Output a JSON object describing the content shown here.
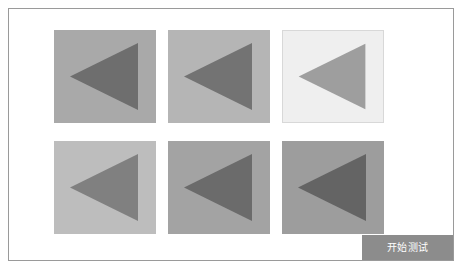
{
  "window": {
    "background": "#ffffff",
    "frame_border_color": "#9a9a9a"
  },
  "grid": {
    "rows": 2,
    "columns": 3,
    "tiles": [
      {
        "index": 0,
        "row": 0,
        "column": 0,
        "name": "tile-0-0",
        "background": "#a9a9a9",
        "shape": "left-pointing-triangle",
        "shape_color": "#6e6e6e",
        "outlined": false
      },
      {
        "index": 1,
        "row": 0,
        "column": 1,
        "name": "tile-0-1",
        "background": "#b5b5b5",
        "shape": "left-pointing-triangle",
        "shape_color": "#737373",
        "outlined": false
      },
      {
        "index": 2,
        "row": 0,
        "column": 2,
        "name": "tile-0-2",
        "background": "#efefef",
        "shape": "left-pointing-triangle",
        "shape_color": "#9e9e9e",
        "outlined": true
      },
      {
        "index": 3,
        "row": 1,
        "column": 0,
        "name": "tile-1-0",
        "background": "#bdbdbd",
        "shape": "left-pointing-triangle",
        "shape_color": "#808080",
        "outlined": false
      },
      {
        "index": 4,
        "row": 1,
        "column": 1,
        "name": "tile-1-1",
        "background": "#a3a3a3",
        "shape": "left-pointing-triangle",
        "shape_color": "#6b6b6b",
        "outlined": false
      },
      {
        "index": 5,
        "row": 1,
        "column": 2,
        "name": "tile-1-2",
        "background": "#9d9d9d",
        "shape": "left-pointing-triangle",
        "shape_color": "#646464",
        "outlined": false
      }
    ]
  },
  "actions": {
    "start_test_label": "开始测试",
    "start_test_background": "#8c8c8c",
    "start_test_text_color": "#ffffff"
  }
}
